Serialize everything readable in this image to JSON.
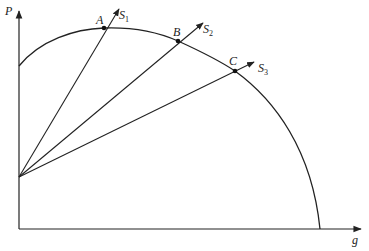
{
  "diagram": {
    "y_axis_label": "P",
    "x_axis_label": "g",
    "curve": {
      "description": "concave frontier curve"
    },
    "origin_point": {
      "x": 19,
      "y": 177
    },
    "points": [
      {
        "id": "A",
        "label": "A",
        "ray_label": "S",
        "ray_sub": "1",
        "x": 104,
        "y": 28
      },
      {
        "id": "B",
        "label": "B",
        "ray_label": "S",
        "ray_sub": "2",
        "x": 178,
        "y": 41
      },
      {
        "id": "C",
        "label": "C",
        "ray_label": "S",
        "ray_sub": "3",
        "x": 235,
        "y": 71
      }
    ],
    "colors": {
      "line": "#222222",
      "background": "#ffffff"
    }
  }
}
